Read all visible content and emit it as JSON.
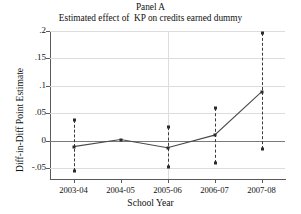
{
  "chart_data": {
    "type": "line",
    "title": "Panel A",
    "subtitle": "Estimated effect of  KP on credits earned dummy",
    "xlabel": "School Year",
    "ylabel": "Diff-in-Diff Point Estimate",
    "categories": [
      "2003-04",
      "2004-05",
      "2005-06",
      "2006-07",
      "2007-08"
    ],
    "values": [
      -0.011,
      0.002,
      -0.013,
      0.01,
      0.089
    ],
    "ci_low": [
      -0.055,
      null,
      -0.049,
      -0.041,
      -0.015
    ],
    "ci_high": [
      0.037,
      null,
      0.024,
      0.06,
      0.197
    ],
    "ylim": [
      -0.07,
      0.2
    ],
    "yticks": [
      -0.05,
      0,
      0.05,
      0.1,
      0.15,
      0.2
    ],
    "ytick_labels": [
      "-.05",
      "0",
      ".05",
      ".1",
      ".15",
      ".2"
    ],
    "grid": true,
    "vertical_gridline_at": "2005-06",
    "zero_reference_line": 0,
    "legend": null,
    "series_color": "#4a4a4a",
    "ci_color": "#3a3a3a",
    "grid_color": "#dcdcdc",
    "axis_color": "#5a5a5a"
  }
}
